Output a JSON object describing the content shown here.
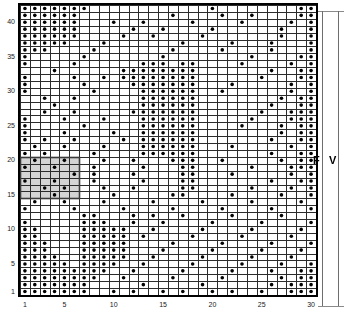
{
  "chart_data": {
    "type": "scatter",
    "title": "",
    "xlabel": "",
    "ylabel": "",
    "xlim": [
      0.5,
      30.5
    ],
    "ylim": [
      0.5,
      42.5
    ],
    "grid": true,
    "legend": "none",
    "ncols": 30,
    "nrows": 42,
    "marker": "filled-circle",
    "marker_color": "#000000",
    "xticks": [
      1,
      5,
      10,
      15,
      20,
      25,
      30
    ],
    "yticks": [
      1,
      5,
      10,
      15,
      20,
      25,
      30,
      35,
      40
    ],
    "xticklabels": [
      "1",
      "5",
      "10",
      "15",
      "20",
      "25",
      "30"
    ],
    "yticklabels": [
      "1",
      "5",
      "10",
      "15",
      "20",
      "25",
      "30",
      "35",
      "40"
    ],
    "highlight_block": {
      "label": "highlighted-sub-block",
      "x_range": [
        1,
        6
      ],
      "y_range": [
        15,
        20
      ],
      "fill": "#d4d4d4",
      "stroke": "#3a3a3a"
    },
    "points": [
      [
        1,
        42
      ],
      [
        2,
        42
      ],
      [
        3,
        42
      ],
      [
        4,
        42
      ],
      [
        5,
        42
      ],
      [
        6,
        42
      ],
      [
        7,
        42
      ],
      [
        20,
        42
      ],
      [
        29,
        42
      ],
      [
        30,
        42
      ],
      [
        1,
        41
      ],
      [
        2,
        41
      ],
      [
        3,
        41
      ],
      [
        4,
        41
      ],
      [
        5,
        41
      ],
      [
        6,
        41
      ],
      [
        16,
        41
      ],
      [
        21,
        41
      ],
      [
        24,
        41
      ],
      [
        29,
        41
      ],
      [
        30,
        41
      ],
      [
        1,
        40
      ],
      [
        2,
        40
      ],
      [
        3,
        40
      ],
      [
        4,
        40
      ],
      [
        5,
        40
      ],
      [
        6,
        40
      ],
      [
        10,
        40
      ],
      [
        13,
        40
      ],
      [
        18,
        40
      ],
      [
        23,
        40
      ],
      [
        28,
        40
      ],
      [
        30,
        40
      ],
      [
        1,
        39
      ],
      [
        2,
        39
      ],
      [
        3,
        39
      ],
      [
        4,
        39
      ],
      [
        5,
        39
      ],
      [
        6,
        39
      ],
      [
        12,
        39
      ],
      [
        15,
        39
      ],
      [
        20,
        39
      ],
      [
        27,
        39
      ],
      [
        30,
        39
      ],
      [
        1,
        38
      ],
      [
        2,
        38
      ],
      [
        3,
        38
      ],
      [
        4,
        38
      ],
      [
        5,
        38
      ],
      [
        6,
        38
      ],
      [
        11,
        38
      ],
      [
        14,
        38
      ],
      [
        19,
        38
      ],
      [
        27,
        38
      ],
      [
        30,
        38
      ],
      [
        1,
        37
      ],
      [
        2,
        37
      ],
      [
        3,
        37
      ],
      [
        4,
        37
      ],
      [
        5,
        37
      ],
      [
        9,
        37
      ],
      [
        17,
        37
      ],
      [
        22,
        37
      ],
      [
        26,
        37
      ],
      [
        30,
        37
      ],
      [
        1,
        36
      ],
      [
        2,
        36
      ],
      [
        3,
        36
      ],
      [
        8,
        36
      ],
      [
        16,
        36
      ],
      [
        21,
        36
      ],
      [
        26,
        36
      ],
      [
        30,
        36
      ],
      [
        1,
        35
      ],
      [
        7,
        35
      ],
      [
        15,
        35
      ],
      [
        24,
        35
      ],
      [
        29,
        35
      ],
      [
        30,
        35
      ],
      [
        1,
        34
      ],
      [
        6,
        34
      ],
      [
        13,
        34
      ],
      [
        14,
        34
      ],
      [
        15,
        34
      ],
      [
        17,
        34
      ],
      [
        18,
        34
      ],
      [
        23,
        34
      ],
      [
        28,
        34
      ],
      [
        30,
        34
      ],
      [
        4,
        33
      ],
      [
        11,
        33
      ],
      [
        12,
        33
      ],
      [
        13,
        33
      ],
      [
        14,
        33
      ],
      [
        15,
        33
      ],
      [
        16,
        33
      ],
      [
        17,
        33
      ],
      [
        18,
        33
      ],
      [
        26,
        33
      ],
      [
        29,
        33
      ],
      [
        30,
        33
      ],
      [
        1,
        32
      ],
      [
        6,
        32
      ],
      [
        9,
        32
      ],
      [
        11,
        32
      ],
      [
        12,
        32
      ],
      [
        13,
        32
      ],
      [
        14,
        32
      ],
      [
        15,
        32
      ],
      [
        16,
        32
      ],
      [
        17,
        32
      ],
      [
        18,
        32
      ],
      [
        25,
        32
      ],
      [
        29,
        32
      ],
      [
        30,
        32
      ],
      [
        1,
        31
      ],
      [
        7,
        31
      ],
      [
        12,
        31
      ],
      [
        13,
        31
      ],
      [
        14,
        31
      ],
      [
        15,
        31
      ],
      [
        16,
        31
      ],
      [
        17,
        31
      ],
      [
        18,
        31
      ],
      [
        22,
        31
      ],
      [
        28,
        31
      ],
      [
        30,
        31
      ],
      [
        1,
        30
      ],
      [
        8,
        30
      ],
      [
        13,
        30
      ],
      [
        14,
        30
      ],
      [
        15,
        30
      ],
      [
        16,
        30
      ],
      [
        17,
        30
      ],
      [
        18,
        30
      ],
      [
        21,
        30
      ],
      [
        28,
        30
      ],
      [
        30,
        30
      ],
      [
        3,
        29
      ],
      [
        6,
        29
      ],
      [
        13,
        29
      ],
      [
        14,
        29
      ],
      [
        15,
        29
      ],
      [
        16,
        29
      ],
      [
        17,
        29
      ],
      [
        18,
        29
      ],
      [
        27,
        29
      ],
      [
        29,
        29
      ],
      [
        30,
        29
      ],
      [
        4,
        28
      ],
      [
        13,
        28
      ],
      [
        14,
        28
      ],
      [
        15,
        28
      ],
      [
        16,
        28
      ],
      [
        17,
        28
      ],
      [
        18,
        28
      ],
      [
        26,
        28
      ],
      [
        29,
        28
      ],
      [
        30,
        28
      ],
      [
        3,
        27
      ],
      [
        6,
        27
      ],
      [
        12,
        27
      ],
      [
        13,
        27
      ],
      [
        14,
        27
      ],
      [
        15,
        27
      ],
      [
        16,
        27
      ],
      [
        17,
        27
      ],
      [
        18,
        27
      ],
      [
        25,
        27
      ],
      [
        28,
        27
      ],
      [
        29,
        27
      ],
      [
        30,
        27
      ],
      [
        1,
        26
      ],
      [
        5,
        26
      ],
      [
        9,
        26
      ],
      [
        13,
        26
      ],
      [
        14,
        26
      ],
      [
        15,
        26
      ],
      [
        16,
        26
      ],
      [
        17,
        26
      ],
      [
        18,
        26
      ],
      [
        24,
        26
      ],
      [
        28,
        26
      ],
      [
        29,
        26
      ],
      [
        30,
        26
      ],
      [
        1,
        25
      ],
      [
        7,
        25
      ],
      [
        13,
        25
      ],
      [
        14,
        25
      ],
      [
        15,
        25
      ],
      [
        16,
        25
      ],
      [
        17,
        25
      ],
      [
        18,
        25
      ],
      [
        23,
        25
      ],
      [
        27,
        25
      ],
      [
        29,
        25
      ],
      [
        30,
        25
      ],
      [
        1,
        24
      ],
      [
        5,
        24
      ],
      [
        10,
        24
      ],
      [
        13,
        24
      ],
      [
        14,
        24
      ],
      [
        15,
        24
      ],
      [
        16,
        24
      ],
      [
        17,
        24
      ],
      [
        18,
        24
      ],
      [
        27,
        24
      ],
      [
        29,
        24
      ],
      [
        30,
        24
      ],
      [
        1,
        23
      ],
      [
        3,
        23
      ],
      [
        6,
        23
      ],
      [
        11,
        23
      ],
      [
        13,
        23
      ],
      [
        14,
        23
      ],
      [
        15,
        23
      ],
      [
        16,
        23
      ],
      [
        17,
        23
      ],
      [
        18,
        23
      ],
      [
        26,
        23
      ],
      [
        29,
        23
      ],
      [
        30,
        23
      ],
      [
        2,
        22
      ],
      [
        5,
        22
      ],
      [
        9,
        22
      ],
      [
        13,
        22
      ],
      [
        14,
        22
      ],
      [
        15,
        22
      ],
      [
        16,
        22
      ],
      [
        17,
        22
      ],
      [
        18,
        22
      ],
      [
        22,
        22
      ],
      [
        28,
        22
      ],
      [
        30,
        22
      ],
      [
        1,
        21
      ],
      [
        3,
        21
      ],
      [
        8,
        21
      ],
      [
        13,
        21
      ],
      [
        14,
        21
      ],
      [
        15,
        21
      ],
      [
        16,
        21
      ],
      [
        17,
        21
      ],
      [
        18,
        21
      ],
      [
        26,
        21
      ],
      [
        29,
        21
      ],
      [
        30,
        21
      ],
      [
        2,
        20
      ],
      [
        5,
        20
      ],
      [
        9,
        20
      ],
      [
        12,
        20
      ],
      [
        16,
        20
      ],
      [
        17,
        20
      ],
      [
        18,
        20
      ],
      [
        21,
        20
      ],
      [
        27,
        20
      ],
      [
        29,
        20
      ],
      [
        30,
        20
      ],
      [
        1,
        19
      ],
      [
        4,
        19
      ],
      [
        8,
        19
      ],
      [
        13,
        19
      ],
      [
        17,
        19
      ],
      [
        18,
        19
      ],
      [
        24,
        19
      ],
      [
        28,
        19
      ],
      [
        29,
        19
      ],
      [
        30,
        19
      ],
      [
        6,
        18
      ],
      [
        8,
        18
      ],
      [
        12,
        18
      ],
      [
        17,
        18
      ],
      [
        18,
        18
      ],
      [
        22,
        18
      ],
      [
        28,
        18
      ],
      [
        30,
        18
      ],
      [
        1,
        17
      ],
      [
        4,
        17
      ],
      [
        8,
        17
      ],
      [
        13,
        17
      ],
      [
        17,
        17
      ],
      [
        18,
        17
      ],
      [
        26,
        17
      ],
      [
        29,
        17
      ],
      [
        30,
        17
      ],
      [
        3,
        16
      ],
      [
        5,
        16
      ],
      [
        9,
        16
      ],
      [
        12,
        16
      ],
      [
        17,
        16
      ],
      [
        18,
        16
      ],
      [
        24,
        16
      ],
      [
        28,
        16
      ],
      [
        30,
        16
      ],
      [
        4,
        15
      ],
      [
        10,
        15
      ],
      [
        16,
        15
      ],
      [
        17,
        15
      ],
      [
        22,
        15
      ],
      [
        27,
        15
      ],
      [
        30,
        15
      ],
      [
        2,
        14
      ],
      [
        5,
        14
      ],
      [
        9,
        14
      ],
      [
        14,
        14
      ],
      [
        19,
        14
      ],
      [
        24,
        14
      ],
      [
        29,
        14
      ],
      [
        1,
        13
      ],
      [
        6,
        13
      ],
      [
        11,
        13
      ],
      [
        16,
        13
      ],
      [
        21,
        13
      ],
      [
        26,
        13
      ],
      [
        30,
        13
      ],
      [
        7,
        12
      ],
      [
        8,
        12
      ],
      [
        12,
        12
      ],
      [
        14,
        12
      ],
      [
        17,
        12
      ],
      [
        22,
        12
      ],
      [
        27,
        12
      ],
      [
        1,
        11
      ],
      [
        7,
        11
      ],
      [
        8,
        11
      ],
      [
        9,
        11
      ],
      [
        12,
        11
      ],
      [
        15,
        11
      ],
      [
        20,
        11
      ],
      [
        25,
        11
      ],
      [
        30,
        11
      ],
      [
        1,
        10
      ],
      [
        2,
        10
      ],
      [
        7,
        10
      ],
      [
        8,
        10
      ],
      [
        9,
        10
      ],
      [
        10,
        10
      ],
      [
        11,
        10
      ],
      [
        14,
        10
      ],
      [
        19,
        10
      ],
      [
        24,
        10
      ],
      [
        29,
        10
      ],
      [
        1,
        9
      ],
      [
        2,
        9
      ],
      [
        7,
        9
      ],
      [
        8,
        9
      ],
      [
        9,
        9
      ],
      [
        10,
        9
      ],
      [
        11,
        9
      ],
      [
        13,
        9
      ],
      [
        18,
        9
      ],
      [
        23,
        9
      ],
      [
        28,
        9
      ],
      [
        1,
        8
      ],
      [
        2,
        8
      ],
      [
        3,
        8
      ],
      [
        7,
        8
      ],
      [
        8,
        8
      ],
      [
        9,
        8
      ],
      [
        10,
        8
      ],
      [
        11,
        8
      ],
      [
        16,
        8
      ],
      [
        21,
        8
      ],
      [
        26,
        8
      ],
      [
        30,
        8
      ],
      [
        1,
        7
      ],
      [
        2,
        7
      ],
      [
        3,
        7
      ],
      [
        7,
        7
      ],
      [
        8,
        7
      ],
      [
        9,
        7
      ],
      [
        10,
        7
      ],
      [
        11,
        7
      ],
      [
        15,
        7
      ],
      [
        20,
        7
      ],
      [
        25,
        7
      ],
      [
        29,
        7
      ],
      [
        1,
        6
      ],
      [
        2,
        6
      ],
      [
        3,
        6
      ],
      [
        4,
        6
      ],
      [
        7,
        6
      ],
      [
        8,
        6
      ],
      [
        9,
        6
      ],
      [
        10,
        6
      ],
      [
        11,
        6
      ],
      [
        14,
        6
      ],
      [
        19,
        6
      ],
      [
        24,
        6
      ],
      [
        28,
        6
      ],
      [
        1,
        5
      ],
      [
        2,
        5
      ],
      [
        3,
        5
      ],
      [
        4,
        5
      ],
      [
        5,
        5
      ],
      [
        7,
        5
      ],
      [
        8,
        5
      ],
      [
        9,
        5
      ],
      [
        10,
        5
      ],
      [
        13,
        5
      ],
      [
        18,
        5
      ],
      [
        23,
        5
      ],
      [
        27,
        5
      ],
      [
        30,
        5
      ],
      [
        1,
        4
      ],
      [
        2,
        4
      ],
      [
        3,
        4
      ],
      [
        4,
        4
      ],
      [
        5,
        4
      ],
      [
        6,
        4
      ],
      [
        7,
        4
      ],
      [
        8,
        4
      ],
      [
        9,
        4
      ],
      [
        12,
        4
      ],
      [
        17,
        4
      ],
      [
        22,
        4
      ],
      [
        26,
        4
      ],
      [
        29,
        4
      ],
      [
        30,
        4
      ],
      [
        1,
        3
      ],
      [
        2,
        3
      ],
      [
        3,
        3
      ],
      [
        4,
        3
      ],
      [
        5,
        3
      ],
      [
        6,
        3
      ],
      [
        7,
        3
      ],
      [
        8,
        3
      ],
      [
        11,
        3
      ],
      [
        16,
        3
      ],
      [
        21,
        3
      ],
      [
        27,
        3
      ],
      [
        29,
        3
      ],
      [
        30,
        3
      ],
      [
        1,
        2
      ],
      [
        2,
        2
      ],
      [
        3,
        2
      ],
      [
        4,
        2
      ],
      [
        5,
        2
      ],
      [
        6,
        2
      ],
      [
        7,
        2
      ],
      [
        13,
        2
      ],
      [
        19,
        2
      ],
      [
        26,
        2
      ],
      [
        28,
        2
      ],
      [
        29,
        2
      ],
      [
        30,
        2
      ],
      [
        1,
        1
      ],
      [
        2,
        1
      ],
      [
        3,
        1
      ],
      [
        4,
        1
      ],
      [
        5,
        1
      ],
      [
        6,
        1
      ],
      [
        7,
        1
      ],
      [
        10,
        1
      ],
      [
        12,
        1
      ],
      [
        15,
        1
      ],
      [
        17,
        1
      ],
      [
        20,
        1
      ],
      [
        22,
        1
      ],
      [
        25,
        1
      ],
      [
        28,
        1
      ],
      [
        29,
        1
      ],
      [
        30,
        1
      ]
    ]
  },
  "margin": {
    "f_label": "F",
    "v_label": "V"
  }
}
